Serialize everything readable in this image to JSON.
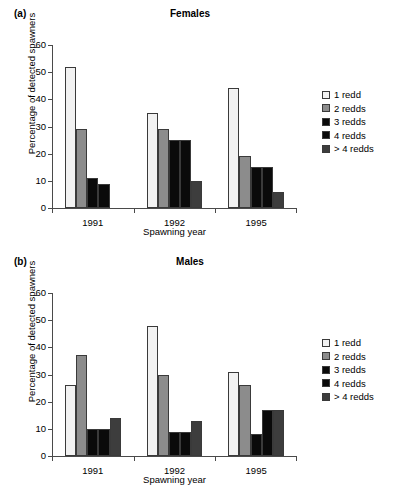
{
  "figure": {
    "axis_title_x": "Spawning year",
    "axis_title_y": "Percentage of detected spawners"
  },
  "panels": [
    {
      "tag": "(a)",
      "title": "Females"
    },
    {
      "tag": "(b)",
      "title": "Males"
    }
  ],
  "legend": {
    "items": [
      {
        "label": "1 redd",
        "color": "#f2f2f2"
      },
      {
        "label": "2 redds",
        "color": "#8c8c8c"
      },
      {
        "label": "3 redds",
        "color": "#0a0a0a"
      },
      {
        "label": "4 redds",
        "color": "#0a0a0a"
      },
      {
        "label": "> 4 redds",
        "color": "#3d3d3d"
      }
    ]
  },
  "axis": {
    "y_ticks": [
      "0",
      "10",
      "20",
      "30",
      "40",
      "50",
      "60"
    ],
    "x_ticks": [
      "1991",
      "1992",
      "1995"
    ]
  },
  "chart_data": [
    {
      "type": "bar",
      "title": "Females",
      "panel": "(a)",
      "xlabel": "Spawning year",
      "ylabel": "Percentage of detected spawners",
      "ylim": [
        0,
        60
      ],
      "ytick_step": 10,
      "grid": false,
      "legend_position": "right",
      "categories": [
        "1991",
        "1992",
        "1995"
      ],
      "series": [
        {
          "name": "1 redd",
          "color": "#f2f2f2",
          "values": [
            52,
            35,
            44
          ]
        },
        {
          "name": "2 redds",
          "color": "#8c8c8c",
          "values": [
            29,
            29,
            19
          ]
        },
        {
          "name": "3 redds",
          "color": "#0a0a0a",
          "values": [
            11,
            25,
            15
          ]
        },
        {
          "name": "4 redds",
          "color": "#0a0a0a",
          "values": [
            9,
            25,
            15
          ]
        },
        {
          "name": "> 4 redds",
          "color": "#3d3d3d",
          "values": [
            0,
            10,
            6
          ]
        }
      ]
    },
    {
      "type": "bar",
      "title": "Males",
      "panel": "(b)",
      "xlabel": "Spawning year",
      "ylabel": "Percentage of detected spawners",
      "ylim": [
        0,
        60
      ],
      "ytick_step": 10,
      "grid": false,
      "legend_position": "right",
      "categories": [
        "1991",
        "1992",
        "1995"
      ],
      "series": [
        {
          "name": "1 redd",
          "color": "#f2f2f2",
          "values": [
            26,
            48,
            31
          ]
        },
        {
          "name": "2 redds",
          "color": "#8c8c8c",
          "values": [
            37,
            30,
            26
          ]
        },
        {
          "name": "3 redds",
          "color": "#0a0a0a",
          "values": [
            10,
            9,
            8
          ]
        },
        {
          "name": "4 redds",
          "color": "#0a0a0a",
          "values": [
            10,
            9,
            17
          ]
        },
        {
          "name": "> 4 redds",
          "color": "#3d3d3d",
          "values": [
            14,
            13,
            17
          ]
        }
      ]
    }
  ]
}
